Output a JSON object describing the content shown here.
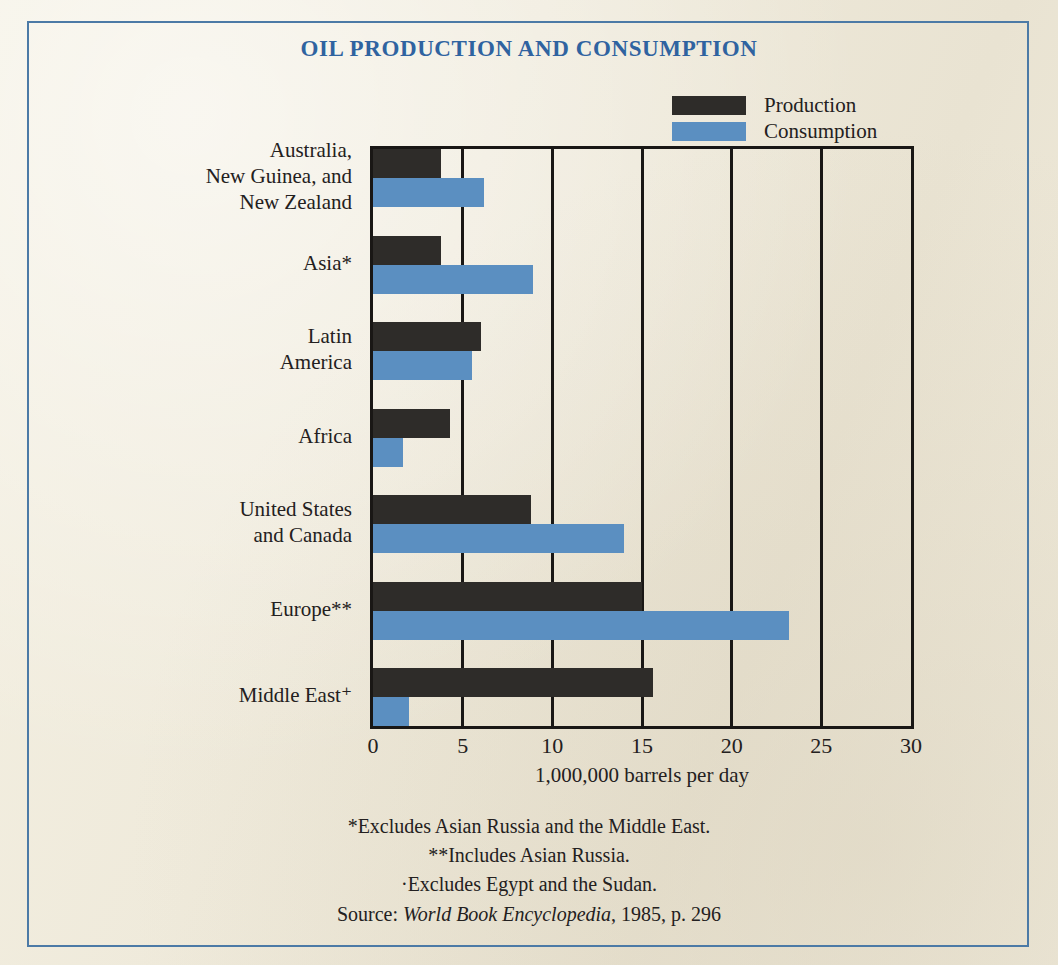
{
  "chart_data": {
    "type": "bar",
    "orientation": "horizontal",
    "title": "OIL PRODUCTION AND CONSUMPTION",
    "xlabel": "1,000,000 barrels per day",
    "ylabel": "",
    "xlim": [
      0,
      30
    ],
    "xticks": [
      "0",
      "5",
      "10",
      "15",
      "20",
      "25",
      "30"
    ],
    "grid": true,
    "legend_position": "top-right",
    "categories": [
      "Australia, New Guinea, and New Zealand",
      "Asia*",
      "Latin America",
      "Africa",
      "United States and Canada",
      "Europe**",
      "Middle East⁺"
    ],
    "category_lines": [
      [
        "Australia,",
        "New Guinea, and",
        "New Zealand"
      ],
      [
        "Asia*"
      ],
      [
        "Latin",
        "America"
      ],
      [
        "Africa"
      ],
      [
        "United States",
        "and Canada"
      ],
      [
        "Europe**"
      ],
      [
        "Middle East⁺"
      ]
    ],
    "series": [
      {
        "name": "Production",
        "color": "#2e2c29",
        "values": [
          3.8,
          3.8,
          6.0,
          4.3,
          8.8,
          15.0,
          15.6
        ]
      },
      {
        "name": "Consumption",
        "color": "#5b8fc1",
        "values": [
          6.2,
          8.9,
          5.5,
          1.7,
          14.0,
          23.2,
          2.0
        ]
      }
    ]
  },
  "legend": {
    "items": [
      {
        "label": "Production",
        "swatch": "production"
      },
      {
        "label": "Consumption",
        "swatch": "consumption"
      }
    ]
  },
  "footnotes": [
    "*Excludes Asian Russia and the Middle East.",
    "**Includes Asian Russia.",
    "·Excludes Egypt and the Sudan."
  ],
  "source": {
    "prefix": "Source: ",
    "title": "World Book Encyclopedia",
    "suffix": ", 1985, p. 296"
  },
  "colors": {
    "frame_border": "#4c7aa6",
    "title_text": "#2f63a0",
    "paper": "#f0ecdd",
    "production": "#2e2c29",
    "consumption": "#5b8fc1",
    "axis": "#191715"
  }
}
